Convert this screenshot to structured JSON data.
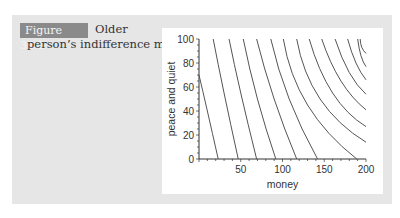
{
  "figure": {
    "badge": "Figure 32.2",
    "title_line1": "Older",
    "title_line2": "person’s indifference map"
  },
  "chart_data": {
    "type": "line",
    "xlabel": "money",
    "ylabel": "peace and quiet",
    "xlim": [
      0,
      200
    ],
    "ylim": [
      0,
      100
    ],
    "xticks": [
      50,
      100,
      150,
      200
    ],
    "yticks": [
      0,
      20,
      40,
      60,
      80,
      100
    ],
    "grid": false,
    "legend": null,
    "series_description": "Indifference curves, concave to origin, concentric around upper-right",
    "series": [
      {
        "name": "curve1",
        "points": [
          [
            0,
            70
          ],
          [
            10,
            40
          ],
          [
            23,
            0
          ]
        ]
      },
      {
        "name": "curve2",
        "points": [
          [
            17,
            100
          ],
          [
            30,
            55
          ],
          [
            47,
            0
          ]
        ]
      },
      {
        "name": "curve3",
        "points": [
          [
            36,
            100
          ],
          [
            50,
            55
          ],
          [
            69,
            0
          ]
        ]
      },
      {
        "name": "curve4",
        "points": [
          [
            53,
            100
          ],
          [
            70,
            50
          ],
          [
            92,
            0
          ]
        ]
      },
      {
        "name": "curve5",
        "points": [
          [
            69,
            100
          ],
          [
            90,
            50
          ],
          [
            117,
            0
          ]
        ]
      },
      {
        "name": "curve6",
        "points": [
          [
            86,
            100
          ],
          [
            108,
            50
          ],
          [
            142,
            0
          ]
        ]
      },
      {
        "name": "curve7",
        "points": [
          [
            101,
            100
          ],
          [
            130,
            45
          ],
          [
            189,
            0
          ]
        ]
      },
      {
        "name": "curve8",
        "points": [
          [
            117,
            100
          ],
          [
            145,
            50
          ],
          [
            200,
            14
          ]
        ]
      },
      {
        "name": "curve9",
        "points": [
          [
            132,
            100
          ],
          [
            160,
            55
          ],
          [
            200,
            27
          ]
        ]
      },
      {
        "name": "curve10",
        "points": [
          [
            147,
            100
          ],
          [
            170,
            65
          ],
          [
            200,
            41
          ]
        ]
      },
      {
        "name": "curve11",
        "points": [
          [
            163,
            100
          ],
          [
            180,
            72
          ],
          [
            200,
            54
          ]
        ]
      },
      {
        "name": "curve12",
        "points": [
          [
            178,
            100
          ],
          [
            188,
            80
          ],
          [
            200,
            66
          ]
        ]
      },
      {
        "name": "curve13",
        "points": [
          [
            190,
            100
          ],
          [
            194,
            86
          ],
          [
            200,
            77
          ]
        ]
      },
      {
        "name": "curve14",
        "points": [
          [
            193,
            100
          ],
          [
            195,
            93
          ],
          [
            200,
            88
          ]
        ]
      }
    ]
  }
}
